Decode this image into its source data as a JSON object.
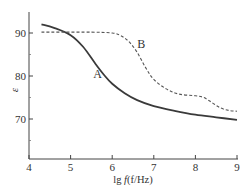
{
  "chart_data": {
    "type": "line",
    "title": "",
    "xlabel": "lg f (f/Hz)",
    "ylabel": "ε",
    "xlim": [
      4,
      9
    ],
    "ylim": [
      61,
      95
    ],
    "xticks": [
      4,
      5,
      6,
      7,
      8,
      9
    ],
    "yticks": [
      70,
      80,
      90
    ],
    "yminor_ticks": [
      65,
      75,
      85
    ],
    "grid": false,
    "legend": "inline labels",
    "series": [
      {
        "name": "A",
        "style": "solid",
        "color": "#3a3a3a",
        "x": [
          4.3,
          4.6,
          5.0,
          5.3,
          5.6,
          5.8,
          6.0,
          6.3,
          6.6,
          7.0,
          7.5,
          8.0,
          8.5,
          9.0
        ],
        "y": [
          92.0,
          91.2,
          89.5,
          86.8,
          82.8,
          80.3,
          78.2,
          76.0,
          74.4,
          73.0,
          71.9,
          71.0,
          70.4,
          69.8
        ]
      },
      {
        "name": "B",
        "style": "dashed",
        "color": "#555555",
        "x": [
          4.3,
          4.8,
          5.5,
          6.0,
          6.2,
          6.4,
          6.6,
          6.8,
          7.0,
          7.3,
          7.6,
          8.0,
          8.2,
          8.4,
          8.6,
          8.8,
          9.0
        ],
        "y": [
          90.2,
          90.2,
          90.2,
          90.0,
          89.4,
          88.0,
          85.5,
          82.0,
          79.2,
          77.0,
          75.8,
          75.4,
          75.0,
          73.8,
          72.6,
          72.0,
          71.8
        ]
      }
    ],
    "annotations": [
      {
        "text": "A",
        "x": 5.65,
        "y": 79.5
      },
      {
        "text": "B",
        "x": 6.7,
        "y": 86.5
      }
    ]
  },
  "axis": {
    "x_label_prefix": "lg ",
    "x_label_f": "f",
    "x_label_paren": "(f/Hz)",
    "y_label": "ε",
    "x_tick_labels": [
      "4",
      "5",
      "6",
      "7",
      "8",
      "9"
    ],
    "y_tick_labels": [
      "90",
      "80",
      "70"
    ]
  }
}
